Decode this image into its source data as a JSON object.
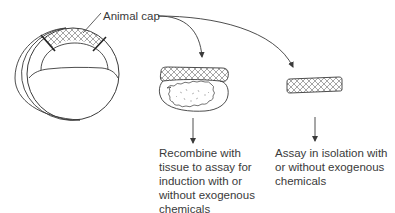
{
  "diagram": {
    "type": "biology-procedure",
    "colors": {
      "stroke": "#3a3a3a",
      "text": "#3a3a3a",
      "hatch": "#6a6a6a",
      "background": "#ffffff"
    },
    "labels": {
      "animal_cap": "Animal cap"
    },
    "nodes": [
      {
        "id": "embryo",
        "name": "Embryo with animal cap region"
      },
      {
        "id": "recombinant",
        "name": "Animal cap recombined with tissue"
      },
      {
        "id": "isolated",
        "name": "Isolated animal cap"
      }
    ],
    "edges": [
      {
        "from": "animal_cap_label",
        "to": "recombinant"
      },
      {
        "from": "animal_cap_label",
        "to": "isolated"
      },
      {
        "from": "recombinant",
        "to": "caption_recombine"
      },
      {
        "from": "isolated",
        "to": "caption_isolation"
      }
    ],
    "captions": {
      "recombine": {
        "lines": [
          "Recombine with",
          "tissue to assay for",
          "induction with or",
          "without exogenous",
          "chemicals"
        ]
      },
      "isolation": {
        "lines": [
          "Assay in isolation with",
          "or without exogenous",
          "chemicals"
        ]
      }
    }
  }
}
